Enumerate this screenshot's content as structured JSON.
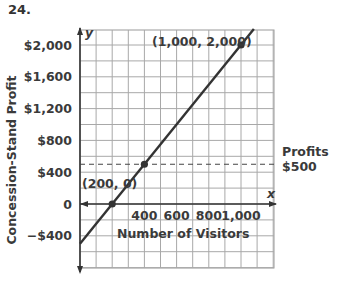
{
  "problem_number": "24.",
  "chart_data": {
    "type": "line",
    "title": "",
    "xlabel": "Number of Visitors",
    "ylabel": "Concession-Stand Profit",
    "x_axis_letter": "x",
    "y_axis_letter": "y",
    "x_ticks": [
      "400",
      "600",
      "800",
      "1,000"
    ],
    "x_tick_values": [
      400,
      600,
      800,
      1000
    ],
    "y_ticks": [
      "$2,000",
      "$1,600",
      "$1,200",
      "$800",
      "$400",
      "0",
      "−$400"
    ],
    "y_tick_values": [
      2000,
      1600,
      1200,
      800,
      400,
      0,
      -400
    ],
    "xlim": [
      0,
      1200
    ],
    "ylim": [
      -800,
      2200
    ],
    "grid": true,
    "series": [
      {
        "name": "Profit line",
        "x": [
          0,
          200,
          400,
          1000
        ],
        "y": [
          -500,
          0,
          500,
          2000
        ]
      }
    ],
    "points": [
      {
        "label": "(200, 0)",
        "x": 200,
        "y": 0
      },
      {
        "label": "",
        "x": 400,
        "y": 500
      },
      {
        "label": "(1,000, 2,000)",
        "x": 1000,
        "y": 2000
      }
    ],
    "reference_line": {
      "y": 500,
      "style": "dashed",
      "label_line1": "Profits",
      "label_line2": "$500"
    }
  }
}
